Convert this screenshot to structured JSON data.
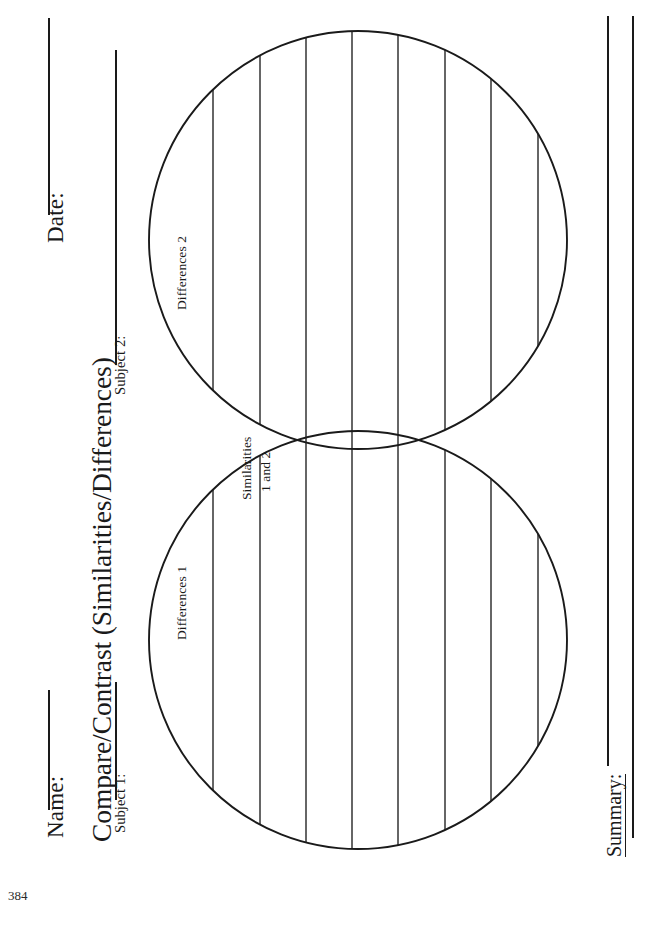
{
  "page": {
    "number": "384",
    "title": "Compare/Contrast (Similarities/Differences)",
    "orientation": "landscape-rotated"
  },
  "header": {
    "name_label": "Name:",
    "date_label": "Date:",
    "subject1_label": "Subject 1:",
    "subject2_label": "Subject 2:",
    "name_value": "",
    "date_value": "",
    "subject1_value": "",
    "subject2_value": ""
  },
  "venn": {
    "left_label": "Differences 1",
    "right_label": "Differences 2",
    "overlap_label_line1": "Similarities",
    "overlap_label_line2": "1 and 2"
  },
  "summary": {
    "label": "Summary:",
    "lines": [
      "",
      ""
    ]
  },
  "colors": {
    "ink": "#1a1a1a",
    "rule": "#333333",
    "paper": "#ffffff"
  }
}
